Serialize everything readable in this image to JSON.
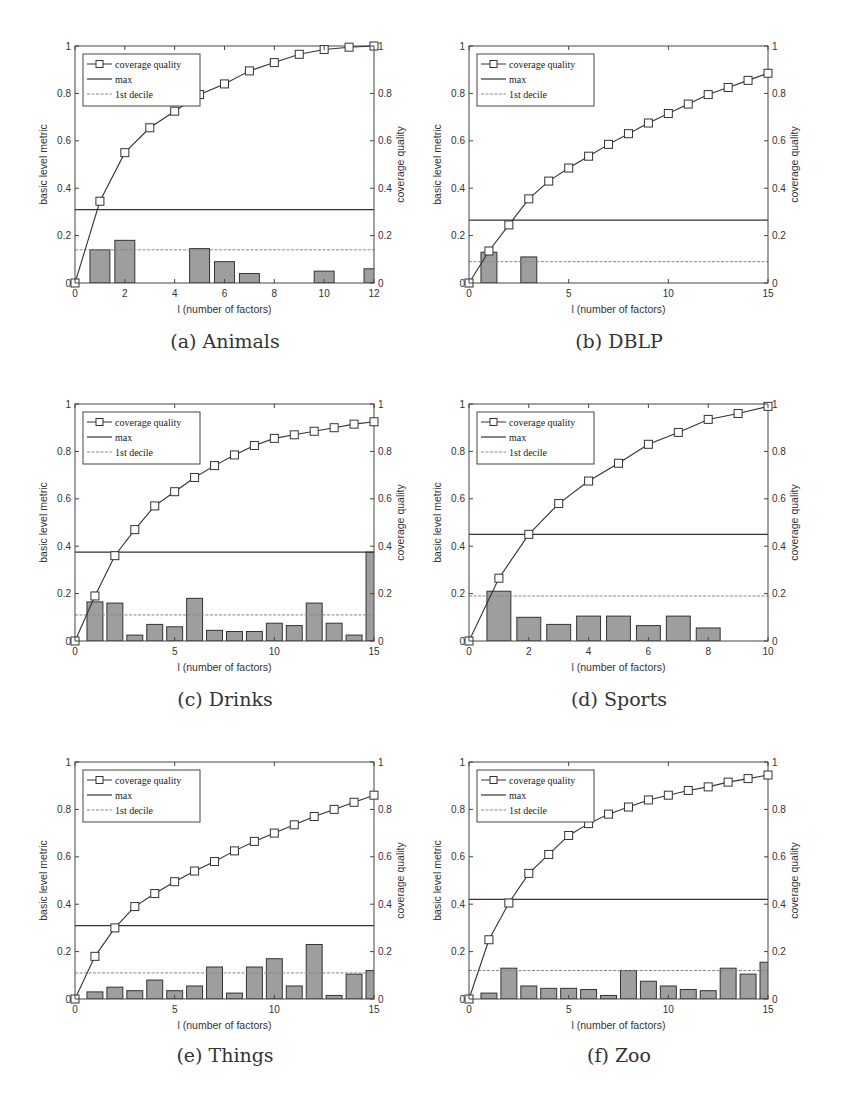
{
  "figure": {
    "panels": [
      {
        "id": "a",
        "caption": "(a) Animals"
      },
      {
        "id": "b",
        "caption": "(b) DBLP"
      },
      {
        "id": "c",
        "caption": "(c) Drinks"
      },
      {
        "id": "d",
        "caption": "(d) Sports"
      },
      {
        "id": "e",
        "caption": "(e) Things"
      },
      {
        "id": "f",
        "caption": "(f) Zoo"
      }
    ]
  },
  "chart_data": [
    {
      "type": "bar+line",
      "title": "(a) Animals",
      "xlabel": "l (number of factors)",
      "ylabel": "basic level metric",
      "ylabel_right": "coverage quality",
      "xlim": [
        0,
        12
      ],
      "ylim": [
        0,
        1
      ],
      "xticks": [
        0,
        2,
        4,
        6,
        8,
        10,
        12
      ],
      "yticks": [
        0,
        0.2,
        0.4,
        0.6,
        0.8,
        1
      ],
      "legend": [
        "coverage quality",
        "max",
        "1st decile"
      ],
      "legend_position": "upper left",
      "bars": {
        "name": "basic level metric",
        "x": [
          1,
          2,
          3,
          4,
          5,
          6,
          7,
          8,
          9,
          10,
          11,
          12
        ],
        "values": [
          0.14,
          0.18,
          0,
          0,
          0.145,
          0.09,
          0.04,
          0,
          0,
          0.05,
          0,
          0.06
        ]
      },
      "coverage_quality": {
        "x": [
          0,
          1,
          2,
          3,
          4,
          5,
          6,
          7,
          8,
          9,
          10,
          11,
          12
        ],
        "values": [
          0,
          0.345,
          0.55,
          0.655,
          0.725,
          0.795,
          0.84,
          0.895,
          0.93,
          0.965,
          0.985,
          0.995,
          1.0
        ]
      },
      "max": 0.31,
      "first_decile": 0.14
    },
    {
      "type": "bar+line",
      "title": "(b) DBLP",
      "xlabel": "l (number of factors)",
      "ylabel": "basic level metric",
      "ylabel_right": "coverage quality",
      "xlim": [
        0,
        15
      ],
      "ylim": [
        0,
        1
      ],
      "xticks": [
        0,
        5,
        10,
        15
      ],
      "yticks": [
        0,
        0.2,
        0.4,
        0.6,
        0.8,
        1
      ],
      "legend": [
        "coverage quality",
        "max",
        "1st decile"
      ],
      "legend_position": "upper left",
      "bars": {
        "name": "basic level metric",
        "x": [
          1,
          2,
          3,
          4,
          5,
          6,
          7,
          8,
          9,
          10,
          11,
          12,
          13,
          14,
          15
        ],
        "values": [
          0.13,
          0,
          0.11,
          0,
          0,
          0,
          0,
          0,
          0,
          0,
          0,
          0,
          0,
          0,
          0
        ]
      },
      "coverage_quality": {
        "x": [
          0,
          1,
          2,
          3,
          4,
          5,
          6,
          7,
          8,
          9,
          10,
          11,
          12,
          13,
          14,
          15
        ],
        "values": [
          0,
          0.135,
          0.245,
          0.355,
          0.43,
          0.485,
          0.535,
          0.585,
          0.63,
          0.675,
          0.715,
          0.755,
          0.795,
          0.825,
          0.855,
          0.885
        ]
      },
      "max": 0.265,
      "first_decile": 0.09
    },
    {
      "type": "bar+line",
      "title": "(c) Drinks",
      "xlabel": "l (number of factors)",
      "ylabel": "basic level metric",
      "ylabel_right": "coverage quality",
      "xlim": [
        0,
        15
      ],
      "ylim": [
        0,
        1
      ],
      "xticks": [
        0,
        5,
        10,
        15
      ],
      "yticks": [
        0,
        0.2,
        0.4,
        0.6,
        0.8,
        1
      ],
      "legend": [
        "coverage quality",
        "max",
        "1st decile"
      ],
      "legend_position": "upper left",
      "bars": {
        "name": "basic level metric",
        "x": [
          1,
          2,
          3,
          4,
          5,
          6,
          7,
          8,
          9,
          10,
          11,
          12,
          13,
          14,
          15
        ],
        "values": [
          0.165,
          0.16,
          0.025,
          0.07,
          0.06,
          0.18,
          0.045,
          0.04,
          0.04,
          0.075,
          0.065,
          0.16,
          0.075,
          0.025,
          0.375
        ]
      },
      "coverage_quality": {
        "x": [
          0,
          1,
          2,
          3,
          4,
          5,
          6,
          7,
          8,
          9,
          10,
          11,
          12,
          13,
          14,
          15
        ],
        "values": [
          0,
          0.19,
          0.36,
          0.47,
          0.57,
          0.63,
          0.69,
          0.74,
          0.785,
          0.825,
          0.855,
          0.87,
          0.885,
          0.9,
          0.915,
          0.925
        ]
      },
      "max": 0.375,
      "first_decile": 0.11
    },
    {
      "type": "bar+line",
      "title": "(d) Sports",
      "xlabel": "l (number of factors)",
      "ylabel": "basic level metric",
      "ylabel_right": "coverage quality",
      "xlim": [
        0,
        10
      ],
      "ylim": [
        0,
        1
      ],
      "xticks": [
        0,
        2,
        4,
        6,
        8,
        10
      ],
      "yticks": [
        0,
        0.2,
        0.4,
        0.6,
        0.8,
        1
      ],
      "legend": [
        "coverage quality",
        "max",
        "1st decile"
      ],
      "legend_position": "upper left",
      "bars": {
        "name": "basic level metric",
        "x": [
          1,
          2,
          3,
          4,
          5,
          6,
          7,
          8,
          9,
          10
        ],
        "values": [
          0.21,
          0.1,
          0.07,
          0.105,
          0.105,
          0.065,
          0.105,
          0.055,
          0,
          0
        ]
      },
      "coverage_quality": {
        "x": [
          0,
          1,
          2,
          3,
          4,
          5,
          6,
          7,
          8,
          9,
          10
        ],
        "values": [
          0,
          0.265,
          0.45,
          0.58,
          0.675,
          0.75,
          0.83,
          0.88,
          0.935,
          0.96,
          0.99
        ]
      },
      "max": 0.45,
      "first_decile": 0.19
    },
    {
      "type": "bar+line",
      "title": "(e) Things",
      "xlabel": "l (number of factors)",
      "ylabel": "basic level metric",
      "ylabel_right": "coverage quality",
      "xlim": [
        0,
        15
      ],
      "ylim": [
        0,
        1
      ],
      "xticks": [
        0,
        5,
        10,
        15
      ],
      "yticks": [
        0,
        0.2,
        0.4,
        0.6,
        0.8,
        1
      ],
      "legend": [
        "coverage quality",
        "max",
        "1st decile"
      ],
      "legend_position": "upper left",
      "bars": {
        "name": "basic level metric",
        "x": [
          1,
          2,
          3,
          4,
          5,
          6,
          7,
          8,
          9,
          10,
          11,
          12,
          13,
          14,
          15
        ],
        "values": [
          0.03,
          0.05,
          0.035,
          0.08,
          0.035,
          0.055,
          0.135,
          0.025,
          0.135,
          0.17,
          0.055,
          0.23,
          0.015,
          0.105,
          0.12
        ]
      },
      "coverage_quality": {
        "x": [
          0,
          1,
          2,
          3,
          4,
          5,
          6,
          7,
          8,
          9,
          10,
          11,
          12,
          13,
          14,
          15
        ],
        "values": [
          0,
          0.18,
          0.3,
          0.39,
          0.445,
          0.495,
          0.54,
          0.58,
          0.625,
          0.665,
          0.7,
          0.735,
          0.77,
          0.8,
          0.83,
          0.86
        ]
      },
      "max": 0.31,
      "first_decile": 0.11
    },
    {
      "type": "bar+line",
      "title": "(f) Zoo",
      "xlabel": "l (number of factors)",
      "ylabel": "basic level metric",
      "ylabel_right": "coverage quality",
      "xlim": [
        0,
        15
      ],
      "ylim": [
        0,
        1
      ],
      "xticks": [
        0,
        5,
        10,
        15
      ],
      "yticks": [
        0,
        0.2,
        0.4,
        0.6,
        0.8,
        1
      ],
      "legend": [
        "coverage quality",
        "max",
        "1st decile"
      ],
      "legend_position": "upper left",
      "bars": {
        "name": "basic level metric",
        "x": [
          1,
          2,
          3,
          4,
          5,
          6,
          7,
          8,
          9,
          10,
          11,
          12,
          13,
          14,
          15
        ],
        "values": [
          0.025,
          0.13,
          0.055,
          0.045,
          0.045,
          0.04,
          0.015,
          0.12,
          0.075,
          0.055,
          0.04,
          0.035,
          0.13,
          0.105,
          0.155
        ]
      },
      "coverage_quality": {
        "x": [
          0,
          1,
          2,
          3,
          4,
          5,
          6,
          7,
          8,
          9,
          10,
          11,
          12,
          13,
          14,
          15
        ],
        "values": [
          0,
          0.25,
          0.405,
          0.53,
          0.61,
          0.69,
          0.74,
          0.78,
          0.81,
          0.84,
          0.86,
          0.88,
          0.895,
          0.915,
          0.93,
          0.945
        ]
      },
      "max": 0.42,
      "first_decile": 0.12
    }
  ],
  "colors": {
    "bar_fill": "#9e9e9e",
    "bar_stroke": "#333333",
    "line": "#333333",
    "axis": "#444444",
    "decile_line": "#888888"
  }
}
